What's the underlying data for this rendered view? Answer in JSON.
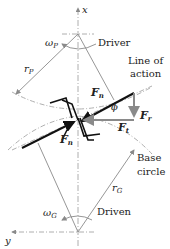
{
  "diagram": {
    "type": "gear force diagram",
    "labels": {
      "x_axis": "x",
      "y_axis": "y",
      "omega_p": "ω",
      "omega_p_sub": "P",
      "driver": "Driver",
      "r_p": "r",
      "r_p_sub": "P",
      "line_of_action_1": "Line of",
      "line_of_action_2": "action",
      "f_n_top": "F",
      "f_n_top_sub": "n",
      "phi": "ϕ",
      "f_r": "F",
      "f_r_sub": "r",
      "f_t": "F",
      "f_t_sub": "t",
      "f_n_bottom": "F",
      "f_n_bottom_sub": "n",
      "base_circle_1": "Base",
      "base_circle_2": "circle",
      "r_g": "r",
      "r_g_sub": "G",
      "omega_g": "ω",
      "omega_g_sub": "G",
      "driven": "Driven"
    },
    "colors": {
      "line_dark": "#111111",
      "line_gray": "#8a8a8a",
      "dashdot": "#9a9a9a"
    }
  }
}
